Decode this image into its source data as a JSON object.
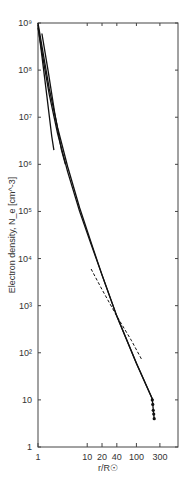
{
  "chart_data": {
    "type": "line",
    "title": "",
    "xlabel": "r/R☉",
    "ylabel": "Electron density, N_e [cm^-3]",
    "xscale": "log",
    "yscale": "log",
    "xlim": [
      1,
      700
    ],
    "ylim": [
      1,
      1000000000
    ],
    "x_ticks": [
      1,
      10,
      20,
      40,
      100,
      300
    ],
    "x_tick_labels": [
      "1",
      "10",
      "20",
      "40",
      "100",
      "300"
    ],
    "y_ticks": [
      1,
      10,
      100,
      1000,
      10000,
      100000,
      1000000,
      10000000,
      100000000,
      1000000000
    ],
    "y_tick_labels": [
      "1",
      "10",
      "10²",
      "10³",
      "10⁴",
      "10⁵",
      "10⁶",
      "10⁷",
      "10⁸",
      "10⁹"
    ],
    "grid": false,
    "legend": null,
    "series": [
      {
        "name": "model A (solid)",
        "style": "solid",
        "x": [
          1.0,
          1.3,
          1.7,
          2.5,
          4,
          7,
          12,
          20,
          40,
          100,
          215
        ],
        "y": [
          1000000000.0,
          200000000.0,
          40000000.0,
          6000000.0,
          900000.0,
          120000.0,
          22000.0,
          4500,
          600,
          60,
          10
        ]
      },
      {
        "name": "model B (solid)",
        "style": "solid",
        "x": [
          1.0,
          1.3,
          1.7,
          2.5,
          4,
          7,
          12,
          20,
          40,
          100,
          215
        ],
        "y": [
          800000000.0,
          150000000.0,
          30000000.0,
          4500000.0,
          700000.0,
          100000.0,
          20000.0,
          4500,
          600,
          60,
          10
        ]
      },
      {
        "name": "model C (solid, steep inner)",
        "style": "solid",
        "x": [
          1.0,
          1.2,
          1.5,
          1.9,
          2.1
        ],
        "y": [
          900000000.0,
          200000000.0,
          30000000.0,
          4000000.0,
          2000000.0
        ]
      },
      {
        "name": "model D (solid, upper)",
        "style": "solid",
        "x": [
          1.2,
          1.6,
          2.2,
          3.0,
          3.6
        ],
        "y": [
          600000000.0,
          100000000.0,
          12000000.0,
          2000000.0,
          1000000.0
        ]
      },
      {
        "name": "dashed",
        "style": "dashed",
        "x": [
          12,
          20,
          40,
          80,
          130
        ],
        "y": [
          6000,
          2200,
          600,
          180,
          70
        ]
      },
      {
        "name": "in situ points",
        "style": "markers",
        "x": [
          210,
          215,
          220,
          225,
          230
        ],
        "y": [
          10,
          8,
          6,
          5,
          4
        ]
      }
    ]
  }
}
